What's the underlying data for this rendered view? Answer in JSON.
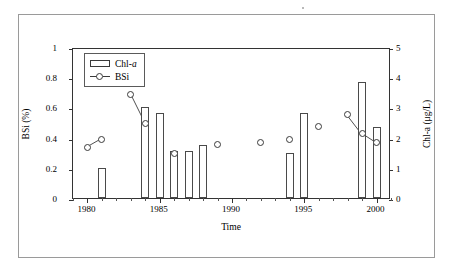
{
  "chart_data": {
    "type": "bar",
    "title": "",
    "subtitle": "",
    "xlabel": "Time",
    "ylabel": "BSi (%)",
    "ylabel_right": "Chl-a (μg/L)",
    "xlim": [
      1979,
      2001
    ],
    "ylim": [
      0,
      1
    ],
    "ylim_right": [
      0,
      5
    ],
    "xticks": [
      1980,
      1985,
      1990,
      1995,
      2000
    ],
    "xtick_labels": [
      "1980",
      "1985",
      "1990",
      "1995",
      "2000"
    ],
    "xminor_step": 1,
    "yticks": [
      0,
      0.2,
      0.4,
      0.6,
      0.8,
      1
    ],
    "ytick_labels": [
      "0",
      "0.2",
      "0.4",
      "0.6",
      "0.8",
      "1"
    ],
    "yticks_right": [
      0,
      1,
      2,
      3,
      4,
      5
    ],
    "ytick_labels_right": [
      "0",
      "1",
      "2",
      "3",
      "4",
      "5"
    ],
    "grid": false,
    "legend_position": "top-left",
    "series": [
      {
        "name": "Chl-a",
        "type": "bar",
        "axis": "right",
        "unit": "μg/L",
        "x": [
          1981,
          1984,
          1985,
          1986,
          1987,
          1988,
          1994,
          1995,
          1999,
          2000
        ],
        "values": [
          1.0,
          3.0,
          2.8,
          1.55,
          1.55,
          1.75,
          1.5,
          2.83,
          3.85,
          2.35
        ]
      },
      {
        "name": "BSi",
        "type": "line-marker",
        "axis": "left",
        "unit": "%",
        "x": [
          1980,
          1981,
          1983,
          1984,
          1986,
          1989,
          1992,
          1994,
          1996,
          1998,
          1999,
          2000
        ],
        "values": [
          0.345,
          0.4,
          0.7,
          0.505,
          0.31,
          0.37,
          0.378,
          0.4,
          0.49,
          0.565,
          0.44,
          0.378
        ],
        "connected_segments": [
          [
            1980,
            1981
          ],
          [
            1983,
            1984
          ],
          [
            1998,
            1999
          ],
          [
            1999,
            2000
          ]
        ]
      }
    ]
  },
  "legend": {
    "items": [
      {
        "label_main": "Chl-",
        "label_italic": "a",
        "marker": "bar-swatch"
      },
      {
        "label_main": "BSi",
        "label_italic": "",
        "marker": "line-circle-swatch"
      }
    ]
  },
  "colors": {
    "bar_outline": "#4a4a4a",
    "marker_outline": "#3a3a3a",
    "axis": "#333333",
    "frame": "#9a9a9a",
    "background": "#ffffff"
  }
}
